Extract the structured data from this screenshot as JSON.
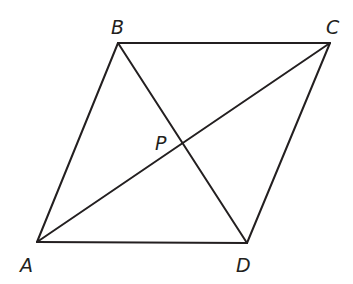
{
  "diagram": {
    "type": "parallelogram-with-diagonals",
    "vertices": {
      "A": {
        "label": "A",
        "x": 37,
        "y": 242,
        "label_x": 20,
        "label_y": 272
      },
      "B": {
        "label": "B",
        "x": 118,
        "y": 43,
        "label_x": 111,
        "label_y": 34
      },
      "C": {
        "label": "C",
        "x": 330,
        "y": 43,
        "label_x": 326,
        "label_y": 34
      },
      "D": {
        "label": "D",
        "x": 247,
        "y": 243,
        "label_x": 236,
        "label_y": 272
      },
      "P": {
        "label": "P",
        "x": 183,
        "y": 144,
        "label_x": 155,
        "label_y": 150
      }
    },
    "sides": [
      {
        "name": "AB",
        "from": "A",
        "to": "B"
      },
      {
        "name": "BC",
        "from": "B",
        "to": "C"
      },
      {
        "name": "CD",
        "from": "C",
        "to": "D"
      },
      {
        "name": "DA",
        "from": "D",
        "to": "A"
      }
    ],
    "diagonals": [
      {
        "name": "AC",
        "from": "A",
        "to": "C"
      },
      {
        "name": "BD",
        "from": "B",
        "to": "D"
      }
    ],
    "intersection": {
      "name": "P",
      "of": [
        "AC",
        "BD"
      ]
    },
    "colors": {
      "line": "#231f20",
      "text": "#231f20",
      "background": "#ffffff"
    }
  }
}
